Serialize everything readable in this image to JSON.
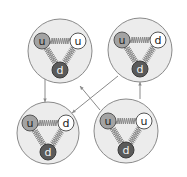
{
  "diagram": {
    "hadrons": [
      {
        "name": "top-left",
        "quarks": [
          {
            "label": "u",
            "color": "gray"
          },
          {
            "label": "u",
            "color": "white"
          },
          {
            "label": "d",
            "color": "dark"
          }
        ]
      },
      {
        "name": "top-right",
        "quarks": [
          {
            "label": "u",
            "color": "gray"
          },
          {
            "label": "d",
            "color": "white"
          },
          {
            "label": "d",
            "color": "dark"
          }
        ]
      },
      {
        "name": "bottom-left",
        "quarks": [
          {
            "label": "u",
            "color": "gray"
          },
          {
            "label": "d",
            "color": "white"
          },
          {
            "label": "d",
            "color": "dark"
          }
        ]
      },
      {
        "name": "bottom-right",
        "quarks": [
          {
            "label": "u",
            "color": "gray"
          },
          {
            "label": "u",
            "color": "white"
          },
          {
            "label": "d",
            "color": "dark"
          }
        ]
      }
    ],
    "transitions": [
      {
        "from": "top-left",
        "to": "bottom-left"
      },
      {
        "from": "top-right",
        "to": "bottom-left"
      },
      {
        "from": "bottom-right",
        "to": "top-left"
      },
      {
        "from": "bottom-right",
        "to": "top-right"
      }
    ],
    "colors": {
      "hadron_fill": "#ececec",
      "quark_gray": "#a3a3a3",
      "quark_white": "#ffffff",
      "quark_dark": "#5a5a5a",
      "line": "#8a8a8a"
    }
  }
}
